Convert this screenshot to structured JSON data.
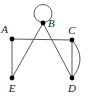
{
  "figure": {
    "kind": "undirected-graph-diagram",
    "width": 90,
    "height": 96,
    "background_color": "#ffffff",
    "edge_color": "#5a5a5a",
    "vertex_color": "#000000",
    "label_color": "#1a1a1a"
  },
  "vertices": [
    {
      "id": "A",
      "label": "A",
      "x": 12,
      "y": 39,
      "label_x": 8,
      "label_y": 33,
      "label_anchor": "end"
    },
    {
      "id": "B",
      "label": "B",
      "x": 43,
      "y": 23,
      "label_x": 48,
      "label_y": 27,
      "label_anchor": "start"
    },
    {
      "id": "C",
      "label": "C",
      "x": 72,
      "y": 40,
      "label_x": 72,
      "label_y": 34,
      "label_anchor": "middle"
    },
    {
      "id": "D",
      "label": "D",
      "x": 72,
      "y": 78,
      "label_x": 72,
      "label_y": 92,
      "label_anchor": "middle"
    },
    {
      "id": "E",
      "label": "E",
      "x": 12,
      "y": 78,
      "label_x": 12,
      "label_y": 92,
      "label_anchor": "middle"
    }
  ],
  "edges": [
    {
      "id": "A-C",
      "from": "A",
      "to": "C",
      "style": "straight"
    },
    {
      "id": "A-E",
      "from": "A",
      "to": "E",
      "style": "straight"
    },
    {
      "id": "B-E",
      "from": "B",
      "to": "E",
      "style": "straight"
    },
    {
      "id": "B-D",
      "from": "B",
      "to": "D",
      "style": "straight"
    },
    {
      "id": "C-D",
      "from": "C",
      "to": "D",
      "style": "straight"
    },
    {
      "id": "C-D-arc",
      "from": "C",
      "to": "D",
      "style": "curved-right"
    },
    {
      "id": "B-B-loop",
      "from": "B",
      "to": "B",
      "style": "self-loop"
    }
  ],
  "loop": {
    "center_x": 43,
    "center_y": 13.5,
    "radius": 9
  },
  "arc": {
    "control_x": 88,
    "control_y": 59
  }
}
